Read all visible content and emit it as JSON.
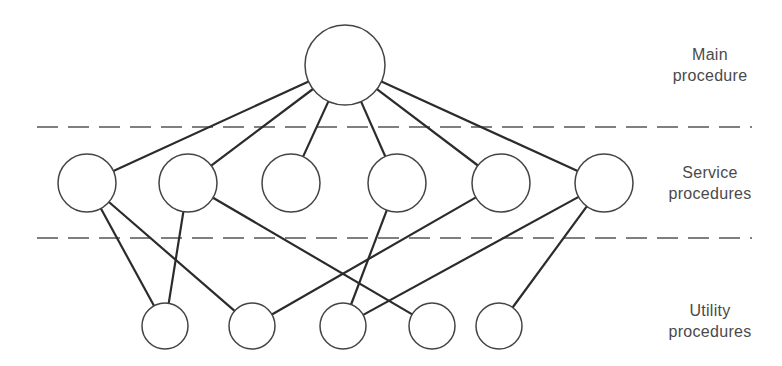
{
  "diagram": {
    "type": "hierarchy",
    "colors": {
      "line": "#2b2b2b",
      "node_stroke": "#444444",
      "dash": "#555555",
      "text": "#4a4a4a"
    },
    "levels": [
      {
        "id": "main",
        "label_line1": "Main",
        "label_line2": "procedure"
      },
      {
        "id": "service",
        "label_line1": "Service",
        "label_line2": "procedures"
      },
      {
        "id": "utility",
        "label_line1": "Utility",
        "label_line2": "procedures"
      }
    ],
    "separators": [
      {
        "y": 127,
        "x1": 37,
        "x2": 752
      },
      {
        "y": 238,
        "x1": 37,
        "x2": 752
      }
    ],
    "nodes": [
      {
        "id": "M",
        "level": "main",
        "cx": 345,
        "cy": 65,
        "r": 40
      },
      {
        "id": "S1",
        "level": "service",
        "cx": 87,
        "cy": 183,
        "r": 29
      },
      {
        "id": "S2",
        "level": "service",
        "cx": 188,
        "cy": 183,
        "r": 29
      },
      {
        "id": "S3",
        "level": "service",
        "cx": 291,
        "cy": 183,
        "r": 29
      },
      {
        "id": "S4",
        "level": "service",
        "cx": 397,
        "cy": 183,
        "r": 29
      },
      {
        "id": "S5",
        "level": "service",
        "cx": 501,
        "cy": 183,
        "r": 29
      },
      {
        "id": "S6",
        "level": "service",
        "cx": 604,
        "cy": 183,
        "r": 29
      },
      {
        "id": "U1",
        "level": "utility",
        "cx": 165,
        "cy": 326,
        "r": 23
      },
      {
        "id": "U2",
        "level": "utility",
        "cx": 252,
        "cy": 326,
        "r": 23
      },
      {
        "id": "U3",
        "level": "utility",
        "cx": 343,
        "cy": 326,
        "r": 23
      },
      {
        "id": "U4",
        "level": "utility",
        "cx": 432,
        "cy": 326,
        "r": 23
      },
      {
        "id": "U5",
        "level": "utility",
        "cx": 499,
        "cy": 326,
        "r": 23
      }
    ],
    "edges": [
      [
        "M",
        "S1"
      ],
      [
        "M",
        "S2"
      ],
      [
        "M",
        "S3"
      ],
      [
        "M",
        "S4"
      ],
      [
        "M",
        "S5"
      ],
      [
        "M",
        "S6"
      ],
      [
        "S1",
        "U1"
      ],
      [
        "S1",
        "U2"
      ],
      [
        "S2",
        "U1"
      ],
      [
        "S2",
        "U4"
      ],
      [
        "S4",
        "U3"
      ],
      [
        "S5",
        "U2"
      ],
      [
        "S6",
        "U3"
      ],
      [
        "S6",
        "U5"
      ]
    ]
  }
}
